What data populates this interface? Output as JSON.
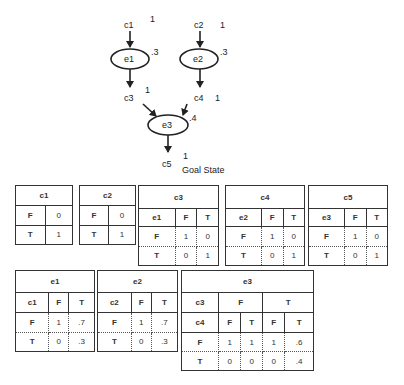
{
  "diagram": {
    "nodes": {
      "c1": {
        "label": "c1",
        "prob": "1"
      },
      "c2": {
        "label": "c2",
        "prob": "1"
      },
      "c3": {
        "label": "c3",
        "prob": "1"
      },
      "c4": {
        "label": "c4",
        "prob": "1"
      },
      "c5": {
        "label": "c5",
        "prob": "1"
      },
      "e1": {
        "label": "e1",
        "prob": ".3"
      },
      "e2": {
        "label": "e2",
        "prob": ".3"
      },
      "e3": {
        "label": "e3",
        "prob": ".4"
      }
    },
    "goal_label": "Goal State"
  },
  "tables": {
    "c1": {
      "title": "c1",
      "rows": [
        [
          "F",
          "0"
        ],
        [
          "T",
          "1"
        ]
      ]
    },
    "c2": {
      "title": "c2",
      "rows": [
        [
          "F",
          "0"
        ],
        [
          "T",
          "1"
        ]
      ]
    },
    "c3": {
      "title": "c3",
      "header": [
        "e1",
        "F",
        "T"
      ],
      "rows": [
        [
          "F",
          "1",
          "0"
        ],
        [
          "T",
          "0",
          "1"
        ]
      ]
    },
    "c4": {
      "title": "c4",
      "header": [
        "e2",
        "F",
        "T"
      ],
      "rows": [
        [
          "F",
          "1",
          "0"
        ],
        [
          "T",
          "0",
          "1"
        ]
      ]
    },
    "c5": {
      "title": "c5",
      "header": [
        "e3",
        "F",
        "T"
      ],
      "rows": [
        [
          "F",
          "1",
          "0"
        ],
        [
          "T",
          "0",
          "1"
        ]
      ]
    },
    "e1": {
      "title": "e1",
      "header": [
        "c1",
        "F",
        "T"
      ],
      "rows": [
        [
          "F",
          "1",
          ".7"
        ],
        [
          "T",
          "0",
          ".3"
        ]
      ]
    },
    "e2": {
      "title": "e2",
      "header": [
        "c2",
        "F",
        "T"
      ],
      "rows": [
        [
          "F",
          "1",
          ".7"
        ],
        [
          "T",
          "0",
          ".3"
        ]
      ]
    },
    "e3": {
      "title": "e3",
      "header1": [
        "c3",
        "F",
        "T"
      ],
      "header2": [
        "c4",
        "F",
        "T",
        "F",
        "T"
      ],
      "rows": [
        [
          "F",
          "1",
          "1",
          "1",
          ".6"
        ],
        [
          "T",
          "0",
          "0",
          "0",
          ".4"
        ]
      ]
    }
  }
}
